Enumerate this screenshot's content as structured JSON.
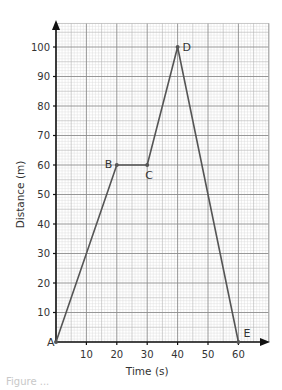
{
  "chart_data": {
    "type": "line",
    "title": "",
    "xlabel": "Time (s)",
    "ylabel": "Distance (m)",
    "xlim": [
      0,
      70
    ],
    "ylim": [
      0,
      108
    ],
    "xticks": [
      10,
      20,
      30,
      40,
      50,
      60
    ],
    "yticks": [
      10,
      20,
      30,
      40,
      50,
      60,
      70,
      80,
      90,
      100
    ],
    "grid": true,
    "legend": null,
    "series": [
      {
        "name": "Distance-time graph",
        "color": "#555555",
        "points": [
          {
            "label": "A",
            "x": 0,
            "y": 0
          },
          {
            "label": "B",
            "x": 20,
            "y": 60
          },
          {
            "label": "C",
            "x": 30,
            "y": 60
          },
          {
            "label": "D",
            "x": 40,
            "y": 100
          },
          {
            "label": "E",
            "x": 60,
            "y": 0
          }
        ]
      }
    ]
  },
  "caption": "Figure ..."
}
